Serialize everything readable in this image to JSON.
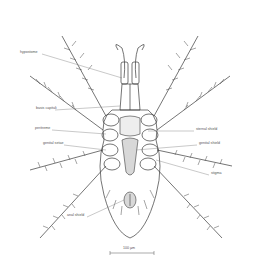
{
  "figure": {
    "labels_left": [
      {
        "id": "hypostome",
        "text": "hypostome",
        "x": 20,
        "y": 52
      },
      {
        "id": "basis-capituli",
        "text": "basis capituli",
        "x": 36,
        "y": 108
      },
      {
        "id": "peritreme",
        "text": "peritreme",
        "x": 35,
        "y": 128
      },
      {
        "id": "genital-setae",
        "text": "genital setae",
        "x": 43,
        "y": 143
      },
      {
        "id": "anal-shield",
        "text": "anal shield",
        "x": 67,
        "y": 215
      }
    ],
    "labels_right": [
      {
        "id": "sternal-shield",
        "text": "sternal shield",
        "x": 196,
        "y": 129
      },
      {
        "id": "genital-shield",
        "text": "genital shield",
        "x": 199,
        "y": 143
      },
      {
        "id": "stigma",
        "text": "stigma",
        "x": 211,
        "y": 173
      }
    ],
    "scale_bar": {
      "text": "100 µm",
      "x1": 110,
      "x2": 154,
      "y": 253
    },
    "colors": {
      "line": "#3a3a3a",
      "shield_fill": "#d8d8d8",
      "label": "#555555",
      "leader": "#777777"
    }
  }
}
